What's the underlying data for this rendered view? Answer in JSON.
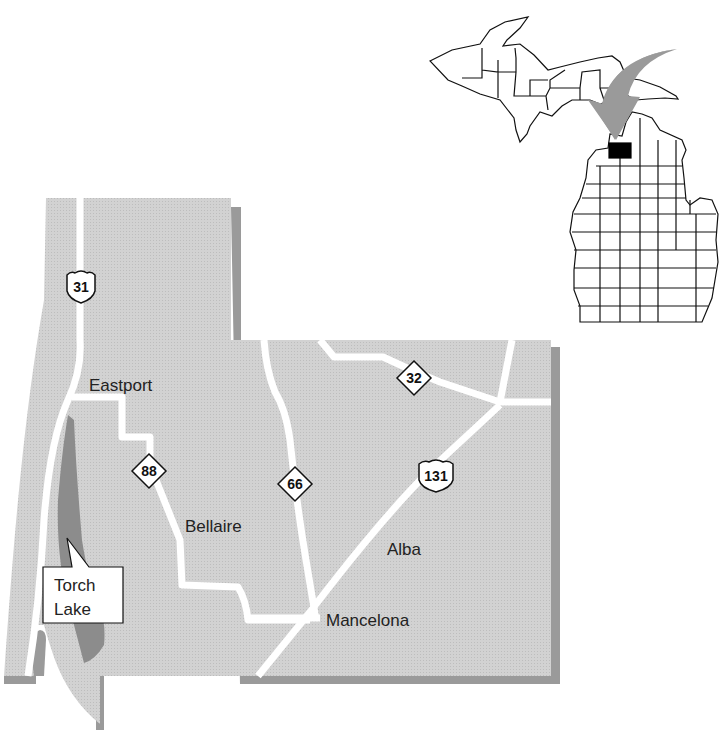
{
  "map": {
    "title": "Antrim County, Michigan",
    "colors": {
      "land": "#cfcfcf",
      "shadow": "#9a9a9a",
      "lake": "#8c8c8c",
      "road": "#ffffff",
      "highlight_county": "#000000",
      "arrow": "#9a9a9a"
    },
    "towns": [
      {
        "name": "Eastport"
      },
      {
        "name": "Bellaire"
      },
      {
        "name": "Alba"
      },
      {
        "name": "Mancelona"
      }
    ],
    "routes": [
      {
        "number": "31",
        "type": "us-highway"
      },
      {
        "number": "131",
        "type": "us-highway"
      },
      {
        "number": "88",
        "type": "state-highway"
      },
      {
        "number": "66",
        "type": "state-highway"
      },
      {
        "number": "32",
        "type": "state-highway"
      }
    ],
    "callout": {
      "line1": "Torch",
      "line2": "Lake"
    },
    "locator": {
      "state": "Michigan",
      "highlighted": "Antrim County"
    }
  }
}
